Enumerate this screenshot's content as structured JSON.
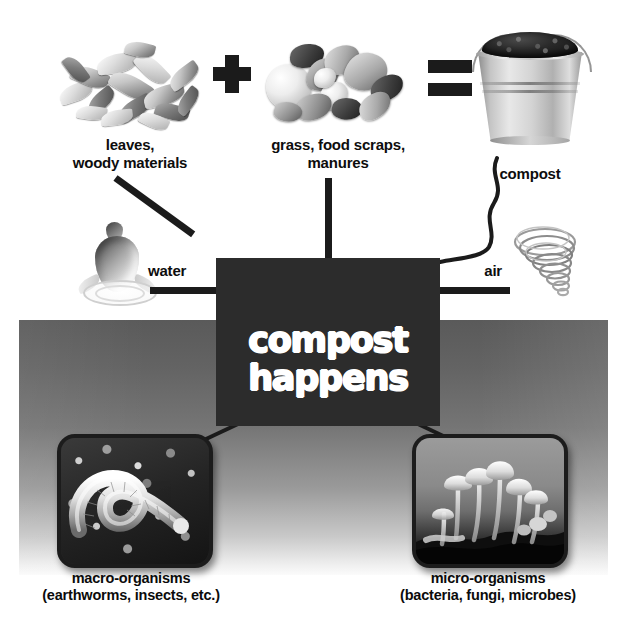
{
  "diagram": {
    "title_line1": "compost",
    "title_line2": "happens",
    "equation": {
      "plus_symbol": "+",
      "equals_symbol": "=",
      "terms": [
        {
          "icon": "leaves-pile-photo",
          "label_line1": "leaves,",
          "label_line2": "woody materials"
        },
        {
          "icon": "food-scraps-photo",
          "label_line1": "grass, food scraps,",
          "label_line2": "manures"
        },
        {
          "icon": "compost-bucket-photo",
          "label_line1": "compost",
          "label_line2": ""
        }
      ]
    },
    "inputs": [
      {
        "icon": "water-drop-icon",
        "label": "water",
        "side": "left"
      },
      {
        "icon": "air-swirl-icon",
        "label": "air",
        "side": "right"
      }
    ],
    "organisms": [
      {
        "icon": "earthworm-photo",
        "label_line1": "macro-organisms",
        "label_line2": "(earthworms, insects, etc.)"
      },
      {
        "icon": "mushrooms-photo",
        "label_line1": "micro-organisms",
        "label_line2": "(bacteria, fungi, microbes)"
      }
    ],
    "colors": {
      "box_fill": "#2c2c2c",
      "box_text": "#ffffff",
      "symbol": "#1b1b1b",
      "connector": "#1b1b1b",
      "ground_top": "#5a5a5a",
      "ground_bottom": "#fbfbfb",
      "page_background": "#ffffff",
      "caption_text": "#0d0d0d"
    }
  }
}
